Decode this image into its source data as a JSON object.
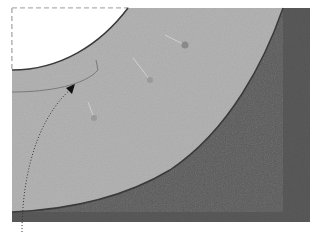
{
  "figure": {
    "colors": {
      "background": "#ffffff",
      "light_fabric": "#b4b4b4",
      "dark_fabric": "#5a5a5a",
      "edge": "#3a3a3a",
      "dashed_outline": "#b0b0b0",
      "pin_head": "#8a8a8a"
    },
    "pins": [
      {
        "x": 185,
        "y": 45
      },
      {
        "x": 150,
        "y": 80
      },
      {
        "x": 94,
        "y": 118
      }
    ]
  }
}
